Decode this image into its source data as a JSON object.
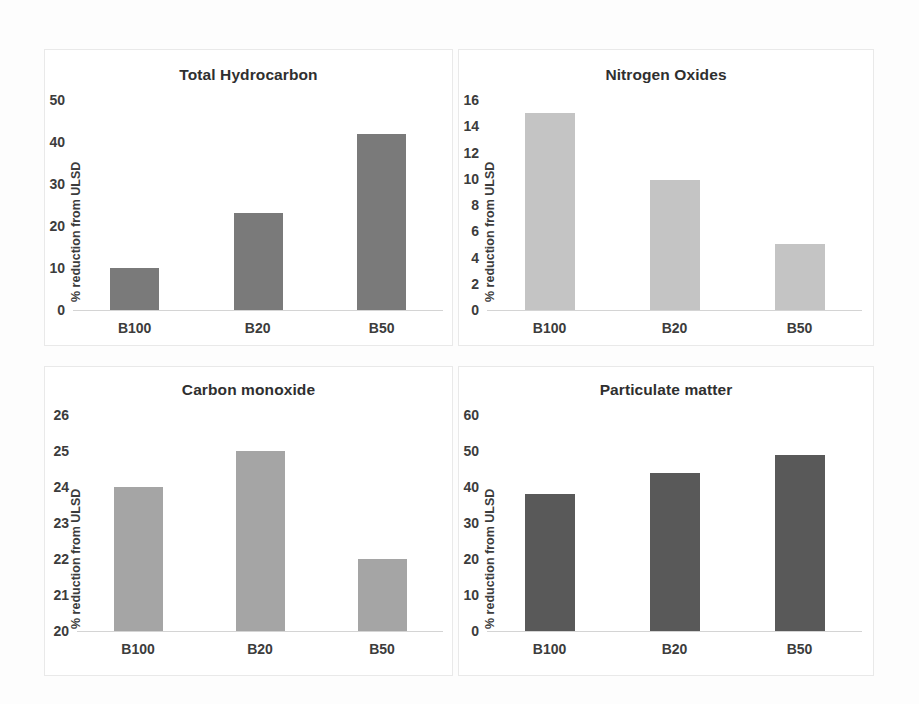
{
  "figure": {
    "background_color": "#fdfdfd",
    "panel_background_color": "#ffffff",
    "panel_border_color": "#e9e9e9"
  },
  "chart_data": [
    {
      "id": "total-hydrocarbon",
      "type": "bar",
      "title": "Total Hydrocarbon",
      "xlabel": "",
      "ylabel": "% reduction from ULSD",
      "categories": [
        "B100",
        "B20",
        "B50"
      ],
      "values": [
        10,
        23,
        42
      ],
      "ylim": [
        0,
        50
      ],
      "yticks": [
        0,
        10,
        20,
        30,
        40,
        50
      ],
      "ytick_labels": [
        "0",
        "10",
        "20",
        "30",
        "40",
        "50"
      ],
      "bar_color": "#7a7a7a",
      "grid": false,
      "legend": "none"
    },
    {
      "id": "nitrogen-oxides",
      "type": "bar",
      "title": "Nitrogen Oxides",
      "xlabel": "",
      "ylabel": "% reduction from ULSD",
      "categories": [
        "B100",
        "B20",
        "B50"
      ],
      "values": [
        15,
        9.9,
        5
      ],
      "ylim": [
        0,
        16
      ],
      "yticks": [
        0,
        2,
        4,
        6,
        8,
        10,
        12,
        14,
        16
      ],
      "ytick_labels": [
        "0",
        "2",
        "4",
        "6",
        "8",
        "10",
        "12",
        "14",
        "16"
      ],
      "bar_color": "#c4c4c4",
      "grid": false,
      "legend": "none"
    },
    {
      "id": "carbon-monoxide",
      "type": "bar",
      "title": "Carbon monoxide",
      "xlabel": "",
      "ylabel": "% reduction from ULSD",
      "categories": [
        "B100",
        "B20",
        "B50"
      ],
      "values": [
        24,
        25,
        22
      ],
      "ylim": [
        20,
        26
      ],
      "yticks": [
        20,
        21,
        22,
        23,
        24,
        25,
        26
      ],
      "ytick_labels": [
        "20",
        "21",
        "22",
        "23",
        "24",
        "25",
        "26"
      ],
      "bar_color": "#a5a5a5",
      "grid": false,
      "legend": "none"
    },
    {
      "id": "particulate-matter",
      "type": "bar",
      "title": "Particulate matter",
      "xlabel": "",
      "ylabel": "% reduction from ULSD",
      "categories": [
        "B100",
        "B20",
        "B50"
      ],
      "values": [
        38,
        44,
        49
      ],
      "ylim": [
        0,
        60
      ],
      "yticks": [
        0,
        10,
        20,
        30,
        40,
        50,
        60
      ],
      "ytick_labels": [
        "0",
        "10",
        "20",
        "30",
        "40",
        "50",
        "60"
      ],
      "bar_color": "#595959",
      "grid": false,
      "legend": "none"
    }
  ],
  "panels": {
    "thc": {
      "title": "Total Hydrocarbon",
      "ylabel": "% reduction from ULSD",
      "chart_index": 0
    },
    "nox": {
      "title": "Nitrogen Oxides",
      "ylabel": "% reduction from ULSD",
      "chart_index": 1
    },
    "co": {
      "title": "Carbon monoxide",
      "ylabel": "% reduction from ULSD",
      "chart_index": 2
    },
    "pm": {
      "title": "Particulate matter",
      "ylabel": "% reduction from ULSD",
      "chart_index": 3
    }
  }
}
